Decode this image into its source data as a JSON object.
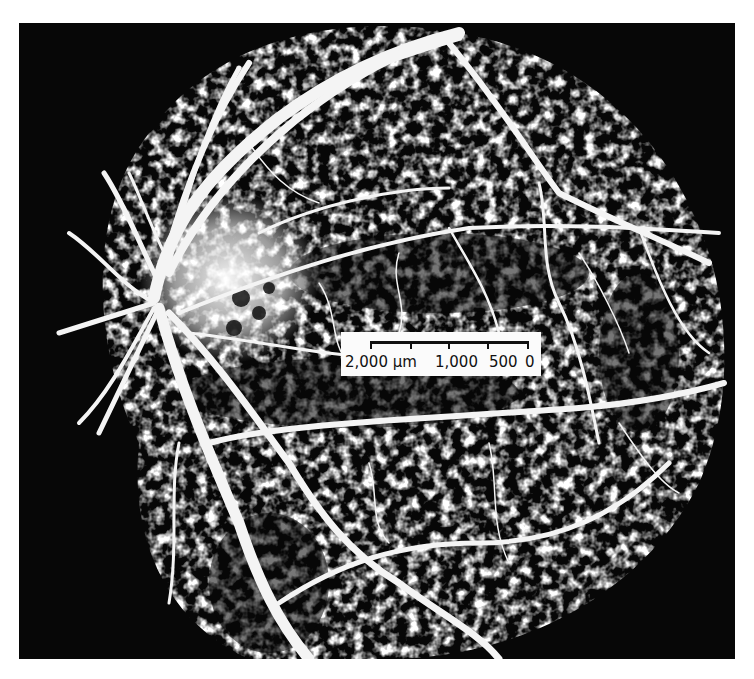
{
  "figure": {
    "background_color": "#ffffff",
    "photo_color": "#070707",
    "vessel_color": "#f4f4f4"
  },
  "scale_bar": {
    "labels": [
      "2,000 μm",
      "1,000",
      "500",
      "0"
    ],
    "label_2000": "2,000 μm",
    "label_1000": "1,000",
    "label_500": "500",
    "label_0": "0"
  }
}
